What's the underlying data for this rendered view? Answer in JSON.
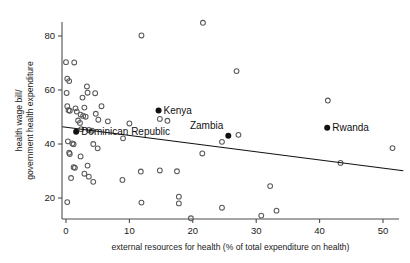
{
  "chart_data": {
    "type": "scatter",
    "title": "",
    "xlabel": "external resources for health (% of total expenditure on health)",
    "ylabel": "health wage bill/\ngovernment health expenditure",
    "ylabel_line1": "health wage bill/",
    "ylabel_line2": "government health expenditure",
    "xlim": [
      -1.5,
      54
    ],
    "ylim": [
      11,
      88
    ],
    "xticks": [
      0,
      10,
      20,
      30,
      40,
      50
    ],
    "xtick_labels": [
      "0",
      "10",
      "20",
      "30",
      "40",
      "50"
    ],
    "yticks": [
      20,
      40,
      60,
      80
    ],
    "ytick_labels": [
      "20",
      "40",
      "60",
      "80"
    ],
    "grid": false,
    "legend": "none",
    "marker_style": "open-circle",
    "series": [
      {
        "name": "countries",
        "marker": "open-circle",
        "points": [
          [
            0.0,
            70.3
          ],
          [
            1.3,
            70.2
          ],
          [
            0.2,
            64.2
          ],
          [
            0.5,
            63.3
          ],
          [
            0.1,
            58.9
          ],
          [
            3.3,
            61.3
          ],
          [
            3.4,
            59.0
          ],
          [
            4.6,
            58.8
          ],
          [
            0.2,
            54.0
          ],
          [
            0.4,
            52.5
          ],
          [
            0.6,
            52.3
          ],
          [
            1.5,
            53.2
          ],
          [
            1.7,
            52.0
          ],
          [
            2.6,
            57.2
          ],
          [
            2.9,
            53.5
          ],
          [
            5.6,
            54.0
          ],
          [
            4.7,
            51.2
          ],
          [
            2.3,
            50.9
          ],
          [
            2.7,
            50.4
          ],
          [
            3.1,
            50.1
          ],
          [
            1.9,
            48.7
          ],
          [
            2.2,
            47.8
          ],
          [
            5.1,
            49.0
          ],
          [
            6.6,
            48.4
          ],
          [
            10.0,
            47.6
          ],
          [
            16.0,
            48.6
          ],
          [
            2.4,
            45.5
          ],
          [
            3.6,
            45.2
          ],
          [
            4.1,
            44.9
          ],
          [
            27.2,
            43.4
          ],
          [
            9.0,
            42.1
          ],
          [
            0.3,
            41.0
          ],
          [
            1.0,
            40.2
          ],
          [
            1.2,
            39.9
          ],
          [
            4.3,
            40.0
          ],
          [
            5.0,
            38.4
          ],
          [
            24.6,
            40.8
          ],
          [
            51.5,
            38.5
          ],
          [
            0.5,
            36.8
          ],
          [
            0.6,
            36.3
          ],
          [
            21.5,
            36.5
          ],
          [
            2.3,
            35.4
          ],
          [
            1.2,
            31.4
          ],
          [
            1.4,
            31.2
          ],
          [
            3.4,
            32.0
          ],
          [
            11.8,
            29.8
          ],
          [
            14.8,
            30.2
          ],
          [
            17.5,
            29.9
          ],
          [
            43.3,
            33.0
          ],
          [
            0.8,
            27.4
          ],
          [
            2.9,
            29.0
          ],
          [
            3.6,
            27.9
          ],
          [
            4.3,
            26.0
          ],
          [
            8.9,
            26.7
          ],
          [
            32.2,
            24.4
          ],
          [
            17.8,
            20.5
          ],
          [
            17.8,
            18.0
          ],
          [
            11.9,
            18.3
          ],
          [
            0.2,
            18.5
          ],
          [
            24.6,
            16.4
          ],
          [
            33.2,
            15.3
          ],
          [
            30.8,
            13.5
          ],
          [
            19.7,
            12.5
          ],
          [
            11.9,
            80.2
          ],
          [
            21.6,
            84.9
          ],
          [
            26.9,
            67.0
          ],
          [
            41.3,
            56.1
          ],
          [
            14.8,
            49.3
          ]
        ]
      }
    ],
    "highlighted_points": [
      {
        "name": "Kenya",
        "x": 14.6,
        "y": 52.4,
        "label_position": "right"
      },
      {
        "name": "Dominican Republic",
        "x": 1.6,
        "y": 44.5,
        "label_position": "right"
      },
      {
        "name": "Zambia",
        "x": 25.6,
        "y": 43.1,
        "label_position": "above-left"
      },
      {
        "name": "Rwanda",
        "x": 41.2,
        "y": 46.0,
        "label_position": "right"
      }
    ],
    "trend_line": {
      "type": "linear-fit",
      "x_start": -0.6,
      "y_start": 46.4,
      "x_end": 53.2,
      "y_end": 30.1
    },
    "colors": {
      "marker_open_stroke": "#5a5a5a",
      "marker_filled": "#111111",
      "trend_line": "#111111",
      "axis": "#4d4d4d",
      "text": "#1a1a1a",
      "background": "#ffffff"
    }
  }
}
